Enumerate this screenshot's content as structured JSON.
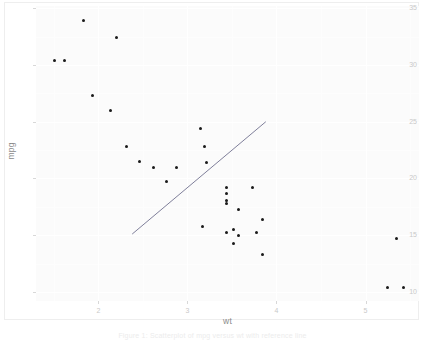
{
  "chart_data": {
    "type": "scatter",
    "title": "",
    "xlabel": "wt",
    "ylabel": "mpg",
    "xlim": [
      1.3,
      5.6
    ],
    "ylim": [
      9.2,
      35.2
    ],
    "xticks": [
      2,
      3,
      4,
      5
    ],
    "yticks": [
      10,
      15,
      20,
      25,
      30,
      35
    ],
    "grid": true,
    "legend": null,
    "points": [
      {
        "x": 1.835,
        "y": 33.9
      },
      {
        "x": 2.2,
        "y": 32.4
      },
      {
        "x": 1.513,
        "y": 30.4
      },
      {
        "x": 1.615,
        "y": 30.4
      },
      {
        "x": 1.935,
        "y": 27.3
      },
      {
        "x": 2.14,
        "y": 26.0
      },
      {
        "x": 3.15,
        "y": 24.4
      },
      {
        "x": 2.32,
        "y": 22.8
      },
      {
        "x": 3.19,
        "y": 22.8
      },
      {
        "x": 2.465,
        "y": 21.5
      },
      {
        "x": 2.62,
        "y": 21.0
      },
      {
        "x": 2.875,
        "y": 21.0
      },
      {
        "x": 3.215,
        "y": 21.4
      },
      {
        "x": 2.77,
        "y": 19.7
      },
      {
        "x": 3.44,
        "y": 19.2
      },
      {
        "x": 3.73,
        "y": 19.2
      },
      {
        "x": 3.44,
        "y": 18.7
      },
      {
        "x": 3.44,
        "y": 18.1
      },
      {
        "x": 3.435,
        "y": 17.8
      },
      {
        "x": 3.57,
        "y": 17.3
      },
      {
        "x": 3.845,
        "y": 16.4
      },
      {
        "x": 3.17,
        "y": 15.8
      },
      {
        "x": 3.435,
        "y": 15.2
      },
      {
        "x": 3.78,
        "y": 15.2
      },
      {
        "x": 3.52,
        "y": 15.5
      },
      {
        "x": 3.57,
        "y": 15.0
      },
      {
        "x": 3.52,
        "y": 14.3
      },
      {
        "x": 3.84,
        "y": 13.3
      },
      {
        "x": 5.25,
        "y": 10.4
      },
      {
        "x": 5.424,
        "y": 10.4
      },
      {
        "x": 5.345,
        "y": 14.7
      }
    ],
    "reference_line": {
      "x0": 2.38,
      "y0": 15.1,
      "x1": 3.88,
      "y1": 25.0,
      "color": "#7f7f9a"
    },
    "caption": "Figure 1: Scatterplot of mpg versus wt with reference line"
  },
  "axis": {
    "x_title": "wt",
    "y_title": "mpg",
    "x_tick_labels": [
      "2",
      "3",
      "4",
      "5"
    ],
    "y_tick_labels": [
      "35",
      "30",
      "25",
      "20",
      "15",
      "10"
    ]
  },
  "colors": {
    "panel_background": "#fbfbfb",
    "gridline": "#ffffff",
    "point": "#1a1a1a",
    "reference_line": "#7f7f9a",
    "tick_label": "#c9c9c9",
    "axis_title": "#8a8a8a",
    "caption": "#ececec"
  }
}
